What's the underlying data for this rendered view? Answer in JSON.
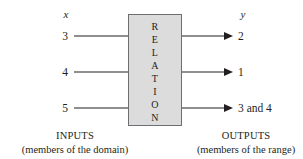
{
  "figure": {
    "type": "relation-block-diagram",
    "colors": {
      "ink": "#231f20",
      "box_fill": "#dcdcdc",
      "box_stroke": "#6d6e71",
      "line": "#231f20",
      "background": "#ffffff"
    },
    "variables": {
      "input_variable": "x",
      "output_variable": "y"
    },
    "box": {
      "label": "RELATION",
      "letters": [
        "R",
        "E",
        "L",
        "A",
        "T",
        "I",
        "O",
        "N"
      ]
    },
    "inputs": [
      {
        "value": "3"
      },
      {
        "value": "4"
      },
      {
        "value": "5"
      }
    ],
    "outputs": [
      {
        "value": "2"
      },
      {
        "value": "1"
      },
      {
        "value": "3 and 4"
      }
    ],
    "captions": {
      "inputs_title": "INPUTS",
      "inputs_subtitle": "(members of the domain)",
      "outputs_title": "OUTPUTS",
      "outputs_subtitle": "(members of the range)"
    }
  }
}
